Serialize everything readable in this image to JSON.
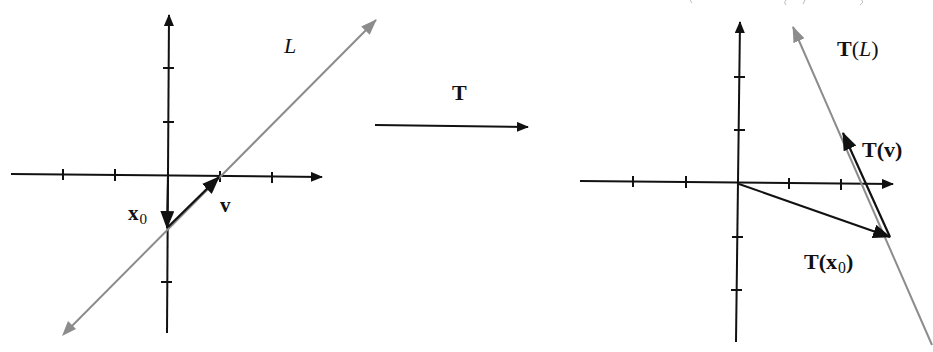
{
  "figure": {
    "transform_label": "T",
    "colors": {
      "axis": "#111111",
      "vector": "#111111",
      "line": "#8c8c8c",
      "background": "#ffffff"
    }
  },
  "left_panel": {
    "line_label": "L",
    "vector_x0_label": "x",
    "vector_x0_sub": "0",
    "vector_v_label": "v",
    "origin": [
      168,
      175
    ],
    "tick_spacing_px": 53,
    "x0_vector": {
      "from": [
        168,
        175
      ],
      "to": [
        167,
        228
      ]
    },
    "v_vector": {
      "from": [
        167,
        228
      ],
      "to": [
        219,
        177
      ]
    },
    "line_L": {
      "from": [
        62,
        336
      ],
      "to": [
        376,
        20
      ]
    }
  },
  "right_panel": {
    "line_label_T": "T",
    "line_label_paren_open": "(",
    "line_label_arg": "L",
    "line_label_paren_close": ")",
    "tv_label": "T(v)",
    "tx0_label": "T(x",
    "tx0_sub": "0",
    "tx0_close": ")",
    "origin": [
      738,
      183
    ],
    "tick_spacing_px": 52,
    "tx0_vector": {
      "from": [
        738,
        183
      ],
      "to": [
        890,
        237
      ]
    },
    "tv_vector": {
      "from": [
        890,
        237
      ],
      "to": [
        843,
        133
      ]
    },
    "line_TL": {
      "from": [
        932,
        345
      ],
      "to": [
        793,
        27
      ]
    }
  }
}
